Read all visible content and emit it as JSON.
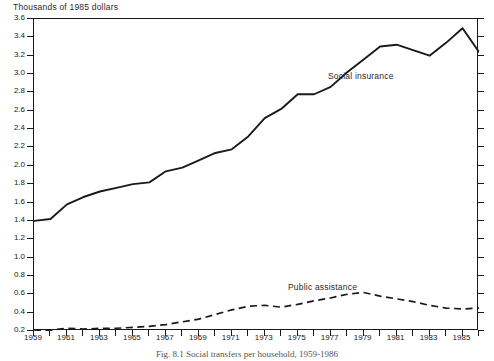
{
  "figure": {
    "axis_title": "Thousands of 1985 dollars",
    "caption": "Fig. 8.1  Social transfers per household, 1959-1986"
  },
  "annotations": {
    "social_insurance_label": "Social insurance",
    "public_assistance_label": "Public assistance"
  },
  "chart_data": {
    "type": "line",
    "title": "",
    "subtitle": "",
    "xlabel": "",
    "ylabel": "Thousands of 1985 dollars",
    "xlim": [
      1959,
      1986
    ],
    "ylim": [
      0.2,
      3.6
    ],
    "ytick_step": 0.2,
    "grid": false,
    "legend": "inline-annotations",
    "ytick_labels": [
      "0.2",
      "0.4",
      "0.6",
      "0.8",
      "1.0",
      "1.2",
      "1.4",
      "1.6",
      "1.8",
      "2.0",
      "2.2",
      "2.4",
      "2.6",
      "2.8",
      "3.0",
      "3.2",
      "3.4",
      "3.6"
    ],
    "xtick_values": [
      1959,
      1960,
      1961,
      1962,
      1963,
      1964,
      1965,
      1966,
      1967,
      1968,
      1969,
      1970,
      1971,
      1972,
      1973,
      1974,
      1975,
      1976,
      1977,
      1978,
      1979,
      1980,
      1981,
      1982,
      1983,
      1984,
      1985,
      1986
    ],
    "xtick_labels": [
      "1959",
      "",
      "1961",
      "",
      "1963",
      "",
      "1965",
      "",
      "1967",
      "",
      "1969",
      "",
      "1971",
      "",
      "1973",
      "",
      "1975",
      "",
      "1977",
      "",
      "1979",
      "",
      "1981",
      "",
      "1983",
      "",
      "1985",
      ""
    ],
    "x": [
      1959,
      1960,
      1961,
      1962,
      1963,
      1964,
      1965,
      1966,
      1967,
      1968,
      1969,
      1970,
      1971,
      1972,
      1973,
      1974,
      1975,
      1976,
      1977,
      1978,
      1979,
      1980,
      1981,
      1982,
      1983,
      1984,
      1985,
      1986
    ],
    "series": [
      {
        "name": "Social insurance",
        "style": "solid",
        "color": "#1a1a1a",
        "values": [
          1.4,
          1.42,
          1.58,
          1.66,
          1.72,
          1.76,
          1.8,
          1.82,
          1.94,
          1.98,
          2.06,
          2.14,
          2.18,
          2.32,
          2.52,
          2.62,
          2.78,
          2.78,
          2.86,
          3.02,
          3.16,
          3.3,
          3.32,
          3.26,
          3.2,
          3.34,
          3.5,
          3.24
        ]
      },
      {
        "name": "Public assistance",
        "style": "dashed",
        "color": "#1a1a1a",
        "values": [
          0.2,
          0.21,
          0.23,
          0.22,
          0.23,
          0.23,
          0.24,
          0.25,
          0.27,
          0.3,
          0.33,
          0.38,
          0.43,
          0.47,
          0.48,
          0.46,
          0.49,
          0.53,
          0.56,
          0.6,
          0.62,
          0.58,
          0.55,
          0.52,
          0.48,
          0.45,
          0.44,
          0.45
        ]
      }
    ]
  },
  "colors": {
    "axis": "#1a1a1a",
    "line": "#1a1a1a",
    "background": "#ffffff"
  }
}
